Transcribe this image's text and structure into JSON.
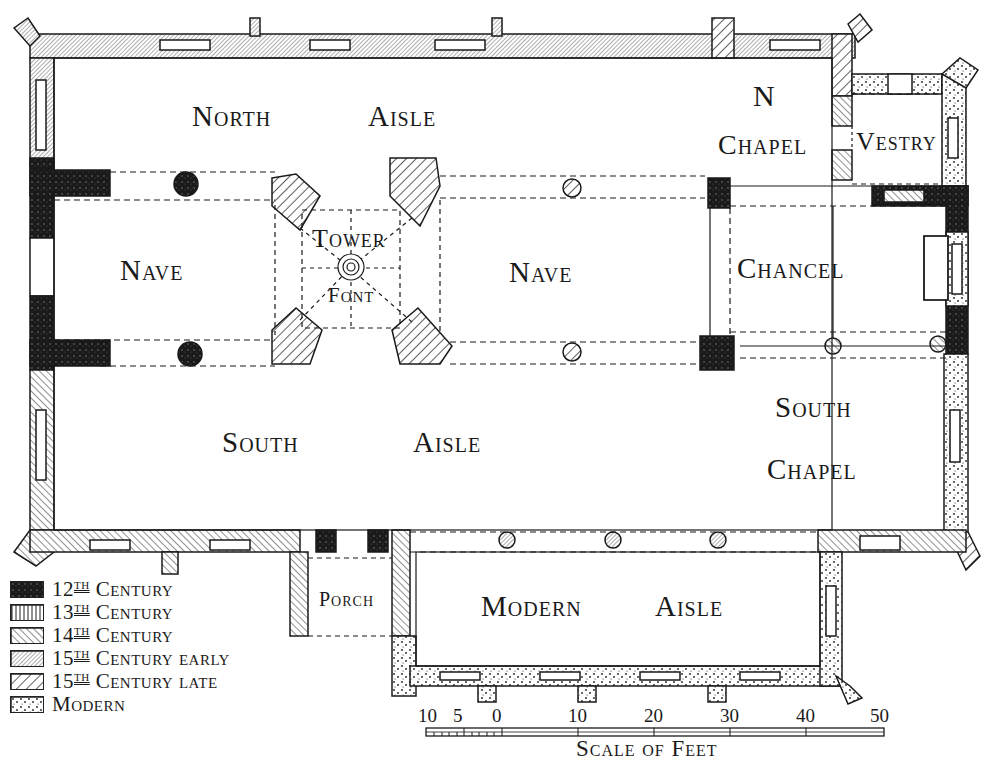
{
  "rooms": {
    "north_aisle": [
      "North",
      "Aisle"
    ],
    "n_chapel": [
      "N",
      "Chapel"
    ],
    "vestry": "Vestry",
    "nave_west": "Nave",
    "tower": "Tower",
    "font": "Font",
    "nave_east": "Nave",
    "chancel": "Chancel",
    "south_aisle": [
      "South",
      "Aisle"
    ],
    "south_chapel": [
      "South",
      "Chapel"
    ],
    "porch": "Porch",
    "modern_aisle": [
      "Modern",
      "Aisle"
    ]
  },
  "legend": {
    "items": [
      {
        "num": "12",
        "sup": "TH",
        "label": "Century",
        "pattern": "12th"
      },
      {
        "num": "13",
        "sup": "TH",
        "label": "Century",
        "pattern": "13th"
      },
      {
        "num": "14",
        "sup": "TH",
        "label": "Century",
        "pattern": "14th"
      },
      {
        "num": "15",
        "sup": "TH",
        "label": "Century early",
        "pattern": "15th-early"
      },
      {
        "num": "15",
        "sup": "TH",
        "label": "Century late",
        "pattern": "15th-late"
      },
      {
        "num": "",
        "sup": "",
        "label": "Modern",
        "pattern": "modern"
      }
    ]
  },
  "scale": {
    "title": "Scale of Feet",
    "ticks": [
      "10",
      "5",
      "0",
      "10",
      "20",
      "30",
      "40",
      "50"
    ]
  },
  "colors": {
    "ink": "#1a1a1a",
    "paper": "#ffffff"
  }
}
